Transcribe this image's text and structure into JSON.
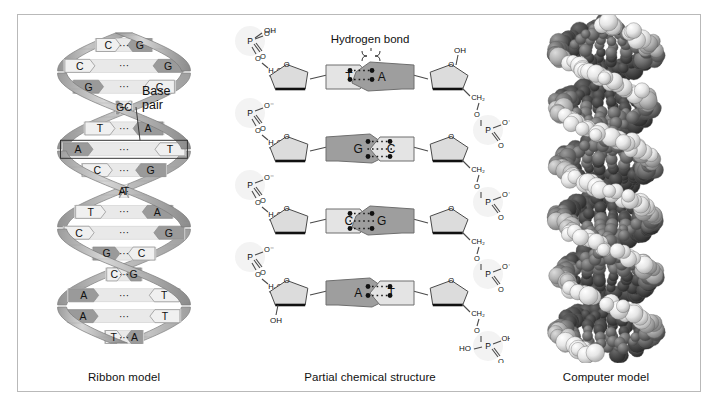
{
  "figure": {
    "background": "#ffffff",
    "border_color": "#b9b9b9"
  },
  "panels": [
    {
      "id": "ribbon",
      "caption": "Ribbon model"
    },
    {
      "id": "chemical",
      "caption": "Partial chemical structure"
    },
    {
      "id": "computer",
      "caption": "Computer model"
    }
  ],
  "ribbon_model": {
    "caption": "Ribbon model",
    "annotation": {
      "line1": "Base",
      "line2": "pair"
    },
    "bond_dots": "···",
    "base_pairs": [
      {
        "left": "C",
        "right": "G"
      },
      {
        "left": "C",
        "right": "G"
      },
      {
        "left": "G",
        "right": "C"
      },
      {
        "left": "G",
        "right": "C"
      },
      {
        "left": "T",
        "right": "A"
      },
      {
        "left": "A",
        "right": "T",
        "highlighted": true
      },
      {
        "left": "C",
        "right": "G"
      },
      {
        "left": "A",
        "right": "T"
      },
      {
        "left": "T",
        "right": "A"
      },
      {
        "left": "C",
        "right": "G"
      },
      {
        "left": "G",
        "right": "C"
      },
      {
        "left": "C",
        "right": "G"
      },
      {
        "left": "A",
        "right": "T"
      },
      {
        "left": "A",
        "right": "T"
      },
      {
        "left": "T",
        "right": "A"
      }
    ],
    "colors": {
      "ribbon_front": "#b9b9b9",
      "ribbon_back": "#8f8f8f",
      "rung_light": "#e9e9e9",
      "base_dark": "#9a9a9a",
      "base_light": "#f0f0f0"
    }
  },
  "chemical_structure": {
    "caption": "Partial chemical structure",
    "annotation": "Hydrogen bond",
    "base_pairs": [
      {
        "left": "T",
        "right": "A",
        "hbonds": 2
      },
      {
        "left": "G",
        "right": "C",
        "hbonds": 3
      },
      {
        "left": "C",
        "right": "G",
        "hbonds": 3
      },
      {
        "left": "A",
        "right": "T",
        "hbonds": 2
      }
    ],
    "atom_labels": {
      "phosphorus": "P",
      "oxygen": "O",
      "hydroxyl": "OH",
      "hydroxyl_acid": "HO",
      "methylene_h2c": "H₂C",
      "methylene_ch2": "CH₂",
      "oxygen_anion": "O⁻"
    },
    "terminus_left_top": "OH",
    "terminus_left_bottom": "OH",
    "terminus_right_top": "OH",
    "terminus_right_bottom": "HO",
    "colors": {
      "bond": "#4a4a4a",
      "sugar_fill": "#dcdcdc",
      "base_dark": "#9e9e9e",
      "base_light": "#e4e4e4",
      "halo": "#f1f1f1"
    }
  },
  "computer_model": {
    "caption": "Computer model",
    "description": "space-filling atomic model of DNA double helix",
    "colors": {
      "atom_light": "#f2f2f2",
      "atom_mid": "#b5b5b5",
      "atom_dark": "#6e6e6e",
      "atom_darkest": "#3c3c3c",
      "groove": "#2a2a2a"
    }
  }
}
